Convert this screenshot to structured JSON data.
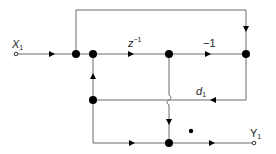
{
  "diagram": {
    "type": "signal-flow-graph",
    "input": {
      "label": "X",
      "subscript": "1"
    },
    "output": {
      "label": "Y",
      "subscript": "1"
    },
    "branch_gains": {
      "delay": {
        "base": "z",
        "exponent": "−1"
      },
      "negate": "−1",
      "coefficient": {
        "base": "d",
        "subscript": "1"
      }
    },
    "nodes": [
      {
        "id": "n1",
        "x": 76,
        "y": 54
      },
      {
        "id": "n2",
        "x": 93,
        "y": 54
      },
      {
        "id": "n3",
        "x": 169,
        "y": 54
      },
      {
        "id": "n4",
        "x": 246,
        "y": 54
      },
      {
        "id": "n5",
        "x": 93,
        "y": 100
      },
      {
        "id": "n6",
        "x": 169,
        "y": 143
      }
    ],
    "stray_dot": {
      "x": 191,
      "y": 131
    }
  }
}
